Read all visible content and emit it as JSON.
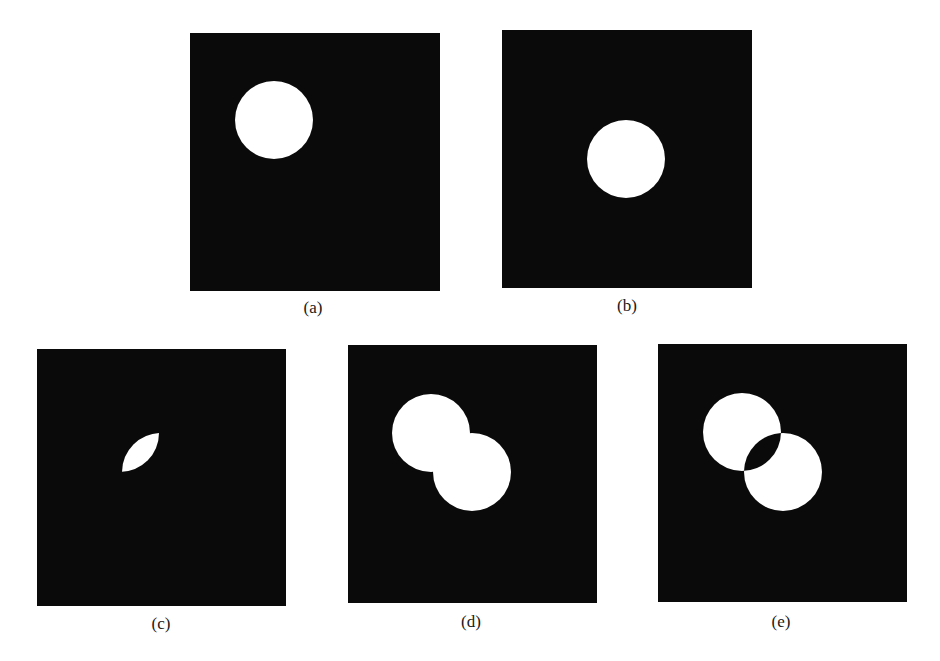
{
  "figure": {
    "colors": {
      "background": "#ffffff",
      "panel_fill": "#0a0a0a",
      "shape_fill": "#ffffff",
      "caption_text": "#1a1a1a"
    },
    "panels": [
      {
        "id": "a",
        "caption": "(a)",
        "description": "Image A: single white disk, upper-left"
      },
      {
        "id": "b",
        "caption": "(b)",
        "description": "Image B: single white disk, center"
      },
      {
        "id": "c",
        "caption": "(c)",
        "description": "A AND B: lens-shaped intersection"
      },
      {
        "id": "d",
        "caption": "(d)",
        "description": "A OR B: union of two overlapping disks"
      },
      {
        "id": "e",
        "caption": "(e)",
        "description": "A XOR B: union with intersection removed"
      }
    ]
  }
}
